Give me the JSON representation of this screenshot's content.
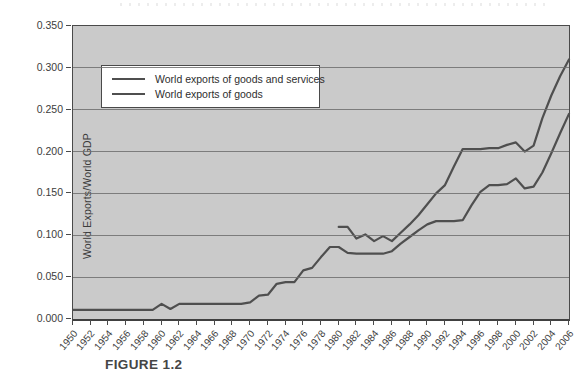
{
  "figure": {
    "caption": "FIGURE 1.2"
  },
  "chart_data": {
    "type": "line",
    "title": "",
    "xlabel": "",
    "ylabel": "World Exports/World GDP",
    "xlim": [
      1950,
      2006
    ],
    "ylim": [
      0,
      0.35
    ],
    "grid": "horizontal",
    "legend_position": "top-left",
    "plot_bg_color": "#cacaca",
    "gridline_color": "#6f6f6f",
    "y_ticks": [
      "0.000",
      "0.050",
      "0.100",
      "0.150",
      "0.200",
      "0.250",
      "0.300",
      "0.350"
    ],
    "x_ticks": [
      1950,
      1952,
      1954,
      1956,
      1958,
      1960,
      1962,
      1964,
      1966,
      1968,
      1970,
      1972,
      1974,
      1976,
      1978,
      1980,
      1982,
      1984,
      1986,
      1988,
      1990,
      1992,
      1994,
      1996,
      1998,
      2000,
      2002,
      2004,
      2006
    ],
    "series": [
      {
        "name": "World exports of goods and services",
        "color": "#4f4f4f",
        "x_start": 1980,
        "values": [
          0.11,
          0.11,
          0.096,
          0.101,
          0.093,
          0.099,
          0.093,
          0.103,
          0.113,
          0.124,
          0.137,
          0.15,
          0.16,
          0.182,
          0.203,
          0.203,
          0.203,
          0.204,
          0.204,
          0.208,
          0.211,
          0.2,
          0.207,
          0.24,
          0.267,
          0.29,
          0.31
        ]
      },
      {
        "name": "World exports of goods",
        "color": "#4f4f4f",
        "x_start": 1950,
        "values": [
          0.011,
          0.011,
          0.011,
          0.011,
          0.011,
          0.011,
          0.011,
          0.011,
          0.011,
          0.011,
          0.018,
          0.012,
          0.018,
          0.018,
          0.018,
          0.018,
          0.018,
          0.018,
          0.018,
          0.018,
          0.02,
          0.028,
          0.029,
          0.042,
          0.044,
          0.044,
          0.058,
          0.061,
          0.074,
          0.086,
          0.086,
          0.079,
          0.078,
          0.078,
          0.078,
          0.078,
          0.081,
          0.09,
          0.098,
          0.106,
          0.113,
          0.117,
          0.117,
          0.117,
          0.118,
          0.136,
          0.152,
          0.16,
          0.16,
          0.161,
          0.168,
          0.156,
          0.158,
          0.175,
          0.198,
          0.222,
          0.245
        ]
      }
    ]
  }
}
